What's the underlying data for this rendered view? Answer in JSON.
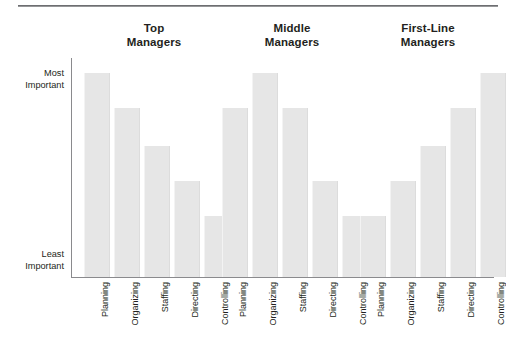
{
  "figure": {
    "background_color": "#ffffff",
    "bar_color": "#e6e6e6",
    "axis_color": "#8a8a8d",
    "text_color": "#231f20"
  },
  "axis": {
    "y_top_label_line1": "Most",
    "y_top_label_line2": "Important",
    "y_bottom_label_line1": "Least",
    "y_bottom_label_line2": "Important"
  },
  "groups": [
    {
      "title_line1": "Top",
      "title_line2": "Managers"
    },
    {
      "title_line1": "Middle",
      "title_line2": "Managers"
    },
    {
      "title_line1": "First-Line",
      "title_line2": "Managers"
    }
  ],
  "categories": [
    "Planning",
    "Organizing",
    "Staffing",
    "Directing",
    "Controlling"
  ],
  "bar_labels": [
    "Planning",
    "Organizing",
    "Staffing",
    "Directing",
    "Controlling",
    "Planning",
    "Organizing",
    "Staffing",
    "Directing",
    "Controlling",
    "Planning",
    "Organizing",
    "Staffing",
    "Directing",
    "Controlling"
  ],
  "chart_data": {
    "type": "bar",
    "title": "",
    "subtitle": "",
    "xlabel": "",
    "ylabel": "",
    "ylim": [
      0,
      100
    ],
    "grid": false,
    "legend_position": "none",
    "axis_tick_labels": {
      "y": [
        "Least Important",
        "Most Important"
      ]
    },
    "categories": [
      "Planning",
      "Organizing",
      "Staffing",
      "Directing",
      "Controlling"
    ],
    "series": [
      {
        "name": "Top Managers",
        "values": [
          93,
          77,
          60,
          44,
          28
        ]
      },
      {
        "name": "Middle Managers",
        "values": [
          77,
          93,
          77,
          44,
          28
        ]
      },
      {
        "name": "First-Line Managers",
        "values": [
          28,
          44,
          60,
          77,
          93
        ]
      }
    ],
    "annotations": [
      "Bar heights are ordinal: higher bar = more important",
      "Y axis ranges from Least Important (bottom) to Most Important (top)"
    ]
  }
}
